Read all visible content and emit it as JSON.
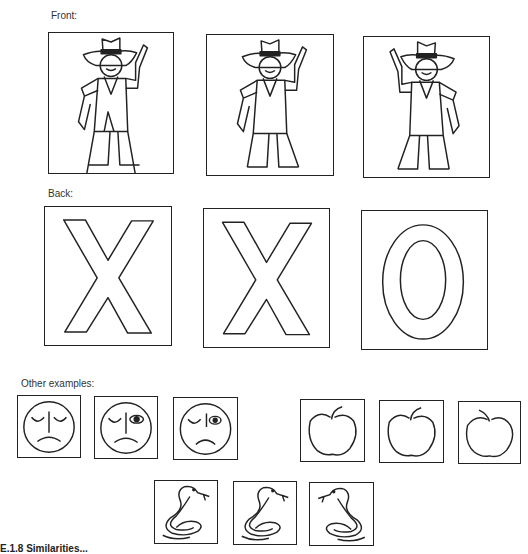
{
  "sections": {
    "front": {
      "label": "Front:"
    },
    "back": {
      "label": "Back:"
    },
    "other": {
      "label": "Other examples:"
    }
  },
  "front_cards": [
    {
      "figure": "cowboy",
      "arm_raised": "right"
    },
    {
      "figure": "cowboy",
      "arm_raised": "right"
    },
    {
      "figure": "cowboy",
      "arm_raised": "left"
    }
  ],
  "back_cards": [
    {
      "letter": "X"
    },
    {
      "letter": "X"
    },
    {
      "letter": "O"
    }
  ],
  "other_examples": {
    "faces": [
      {
        "figure": "sad-face",
        "eyes": "both-closed"
      },
      {
        "figure": "sad-face",
        "eyes": "right-open"
      },
      {
        "figure": "sad-face",
        "eyes": "right-open"
      }
    ],
    "apples": [
      {
        "figure": "apple",
        "stem": "right"
      },
      {
        "figure": "apple",
        "stem": "right"
      },
      {
        "figure": "apple",
        "stem": "left"
      }
    ],
    "snakes": [
      {
        "figure": "snake",
        "facing": "right"
      },
      {
        "figure": "snake",
        "facing": "right"
      },
      {
        "figure": "snake",
        "facing": "left"
      }
    ]
  },
  "caption": "E.1.8    Similarities..."
}
